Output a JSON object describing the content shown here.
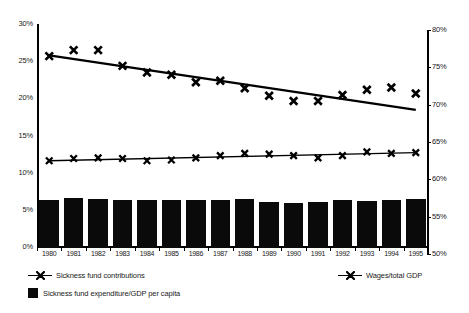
{
  "chart_data": {
    "type": "bar",
    "title": "",
    "subtitle": "",
    "xlabel": "",
    "ylabel": "",
    "y2label": "",
    "grid": false,
    "legend_position": "bottom",
    "categories": [
      "1980",
      "1981",
      "1982",
      "1983",
      "1984",
      "1985",
      "1986",
      "1987",
      "1988",
      "1989",
      "1990",
      "1991",
      "1992",
      "1993",
      "1994",
      "1995"
    ],
    "ylim": [
      0,
      30
    ],
    "yticks": [
      "0%",
      "5%",
      "10%",
      "15%",
      "20%",
      "25%",
      "30%"
    ],
    "ytick_values": [
      0,
      5,
      10,
      15,
      20,
      25,
      30
    ],
    "y2lim": [
      50,
      80
    ],
    "y2ticks": [
      "50%",
      "55%",
      "60%",
      "65%",
      "70%",
      "75%",
      "80%"
    ],
    "y2tick_values": [
      50,
      55,
      60,
      65,
      70,
      75,
      80
    ],
    "series": [
      {
        "name": "Sickness fund expenditure/GDP per capita",
        "type": "bar",
        "axis": "left",
        "color": "#0a0a0a",
        "values": [
          6.5,
          6.7,
          6.6,
          6.4,
          6.4,
          6.5,
          6.5,
          6.5,
          6.6,
          6.2,
          6.1,
          6.2,
          6.4,
          6.3,
          6.5,
          6.6
        ]
      },
      {
        "name": "Sickness fund contributions",
        "type": "scatter-with-trend",
        "axis": "left",
        "color": "#000000",
        "marker": "x",
        "values": [
          11.6,
          11.9,
          12.0,
          11.9,
          11.6,
          11.7,
          12.0,
          12.3,
          12.6,
          12.5,
          12.3,
          12.0,
          12.3,
          12.8,
          12.6,
          12.7
        ],
        "trend": [
          11.6,
          12.7
        ]
      },
      {
        "name": "Wages/total GDP",
        "type": "scatter-with-trend",
        "axis": "right",
        "color": "#000000",
        "marker": "x",
        "values": [
          76.5,
          77.3,
          77.3,
          75.2,
          74.3,
          74.0,
          73.0,
          73.2,
          72.2,
          71.2,
          70.5,
          70.5,
          71.3,
          72.0,
          72.3,
          71.5
        ],
        "trend": [
          76.6,
          69.3
        ]
      }
    ]
  },
  "legend": {
    "contributions_label": "Sickness fund contributions",
    "wages_label": "Wages/total GDP",
    "expenditure_label": "Sickness fund expenditure/GDP per capita"
  }
}
